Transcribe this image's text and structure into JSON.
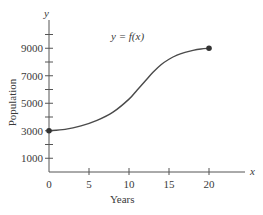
{
  "chart_data": {
    "type": "line",
    "title": "",
    "annotation": "y = f(x)",
    "xlabel": "Years",
    "ylabel": "Population",
    "x_axis_var": "x",
    "y_axis_var": "y",
    "xlim": [
      0,
      25
    ],
    "ylim": [
      0,
      10500
    ],
    "x_ticks": [
      0,
      5,
      10,
      15,
      20
    ],
    "x_tick_labels": [
      "0",
      "5",
      "10",
      "15",
      "20"
    ],
    "y_ticks": [
      1000,
      2000,
      3000,
      4000,
      5000,
      6000,
      7000,
      8000,
      9000,
      10000
    ],
    "y_tick_labels": [
      "1000",
      "3000",
      "5000",
      "7000",
      "9000"
    ],
    "grid": false,
    "legend": null,
    "series": [
      {
        "name": "y = f(x)",
        "x": [
          0,
          2,
          4,
          6,
          8,
          10,
          11,
          12,
          13,
          14,
          15,
          16,
          17,
          18,
          19,
          20
        ],
        "y": [
          3000,
          3100,
          3350,
          3750,
          4350,
          5300,
          5950,
          6600,
          7250,
          7800,
          8200,
          8500,
          8700,
          8850,
          8950,
          9000
        ],
        "endpoints_marked": true,
        "color": "#4a4a4a"
      }
    ]
  }
}
